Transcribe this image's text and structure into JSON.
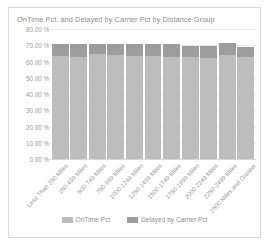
{
  "chart_data": {
    "type": "bar",
    "stacked": true,
    "title": "OnTime Pct. and Delayed by Carrier Pct by Distance Group",
    "xlabel": "",
    "ylabel": "",
    "ylim": [
      0,
      80
    ],
    "ytick_labels": [
      "80.00 %",
      "70.00 %",
      "60.00 %",
      "50.00 %",
      "40.00 %",
      "30.00 %",
      "20.00 %",
      "10.00 %",
      "0.00 %"
    ],
    "ytick_values": [
      80,
      70,
      60,
      50,
      40,
      30,
      20,
      10,
      0
    ],
    "grid": true,
    "legend_position": "bottom",
    "categories": [
      "Less Than 250 Miles",
      "250-499 Miles",
      "500-749 Miles",
      "750-999 Miles",
      "1000-1249 Miles",
      "1250-1499 Miles",
      "1500-1749 Miles",
      "1750-1999 Miles",
      "2000-2249 Miles",
      "2250-2499 Miles",
      "2500 Miles and Greater"
    ],
    "series": [
      {
        "name": "OnTime Pct",
        "color": "#bdbdbd",
        "values": [
          63.5,
          63.0,
          64.5,
          64.0,
          63.5,
          63.5,
          63.0,
          62.5,
          62.0,
          64.0,
          62.5
        ]
      },
      {
        "name": "Delayed by Carrier Pct",
        "color": "#9d9d9d",
        "values": [
          7.5,
          8.0,
          6.0,
          7.0,
          7.5,
          7.5,
          7.5,
          7.0,
          7.5,
          7.5,
          6.5
        ]
      }
    ],
    "legend": [
      {
        "label": "OnTime Pct",
        "color": "#bdbdbd"
      },
      {
        "label": "Delayed by Carrier Pct",
        "color": "#9d9d9d"
      }
    ]
  }
}
